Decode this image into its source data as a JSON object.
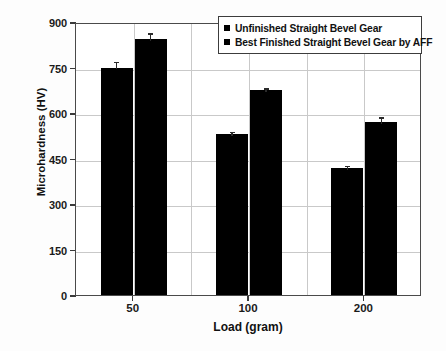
{
  "chart_data": {
    "type": "bar",
    "title": "",
    "xlabel": "Load (gram)",
    "ylabel": "Microhardness (HV)",
    "categories": [
      "50",
      "100",
      "200"
    ],
    "ylim": [
      0,
      900
    ],
    "ytick_labels": [
      "0",
      "150",
      "300",
      "450",
      "600",
      "750",
      "900"
    ],
    "ytick_values": [
      0,
      150,
      300,
      450,
      600,
      750,
      900
    ],
    "grid": true,
    "legend_position": "top-right",
    "bar_color": "#000000",
    "series": [
      {
        "name": "Unfinished Straight Bevel Gear",
        "values": [
          750,
          530,
          420
        ],
        "errors": [
          26,
          14,
          12
        ]
      },
      {
        "name": "Best Finished Straight Bevel Gear by AFF",
        "values": [
          845,
          675,
          570
        ],
        "errors": [
          25,
          13,
          22
        ]
      }
    ]
  },
  "legend": {
    "items": [
      {
        "label": "Unfinished Straight Bevel Gear"
      },
      {
        "label": "Best Finished Straight Bevel Gear by AFF"
      }
    ]
  },
  "axes": {
    "y_title": "Microhardness (HV)",
    "x_title": "Load (gram)"
  }
}
